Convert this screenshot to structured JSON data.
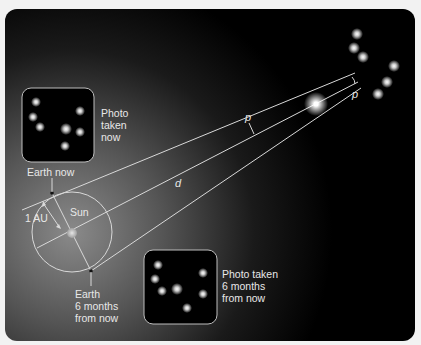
{
  "diagram": {
    "colors": {
      "panel_dark": "#000000",
      "panel_glow": "#6a6a6a",
      "line": "#d9d9d9",
      "text": "#e8e8e8",
      "page_bg": "#f2f2f2"
    },
    "labels": {
      "photo_now": [
        "Photo",
        "taken",
        "now"
      ],
      "photo_later": [
        "Photo taken",
        "6 months",
        "from now"
      ],
      "earth_now": "Earth now",
      "earth_later": [
        "Earth",
        "6 months",
        "from now"
      ],
      "sun": "Sun",
      "au": "1 AU",
      "distance": "d",
      "parallax_near": "p",
      "parallax_far": "p"
    },
    "geometry": {
      "orbit_center": [
        72,
        232
      ],
      "orbit_radius": 40,
      "earth_now": [
        52,
        193
      ],
      "earth_later": [
        91,
        271
      ],
      "sun": [
        72,
        233
      ],
      "target_star": [
        316,
        104
      ]
    },
    "photo_now_stars": [
      [
        36,
        102
      ],
      [
        33,
        117
      ],
      [
        40,
        127
      ],
      [
        66,
        129
      ],
      [
        80,
        111
      ],
      [
        80,
        132
      ],
      [
        65,
        146
      ]
    ],
    "photo_later_stars": [
      [
        158,
        265
      ],
      [
        155,
        279
      ],
      [
        162,
        291
      ],
      [
        177,
        289
      ],
      [
        203,
        273
      ],
      [
        203,
        294
      ],
      [
        187,
        308
      ]
    ],
    "background_stars": [
      [
        357,
        34
      ],
      [
        354,
        48
      ],
      [
        363,
        57
      ],
      [
        394,
        66
      ],
      [
        387,
        82
      ],
      [
        378,
        94
      ]
    ]
  }
}
